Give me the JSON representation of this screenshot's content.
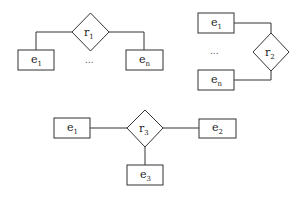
{
  "diagrams": [
    {
      "relationship": {
        "base": "r",
        "sub": "1"
      },
      "entities": [
        {
          "base": "e",
          "sub": "1"
        },
        {
          "base": "e",
          "sub": "n"
        }
      ],
      "ellipsis": "..."
    },
    {
      "relationship": {
        "base": "r",
        "sub": "2"
      },
      "entities": [
        {
          "base": "e",
          "sub": "1"
        },
        {
          "base": "e",
          "sub": "n"
        }
      ],
      "ellipsis": "..."
    },
    {
      "relationship": {
        "base": "r",
        "sub": "3"
      },
      "entities": [
        {
          "base": "e",
          "sub": "1"
        },
        {
          "base": "e",
          "sub": "2"
        },
        {
          "base": "e",
          "sub": "3"
        }
      ]
    }
  ],
  "colors": {
    "stroke": "#333333",
    "background": "#ffffff"
  }
}
